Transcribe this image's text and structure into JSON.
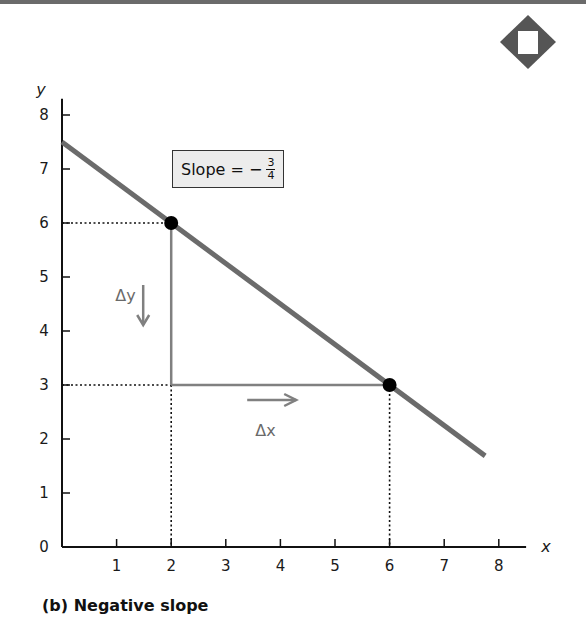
{
  "chart_data": {
    "type": "line",
    "title": "",
    "caption": "(b) Negative slope",
    "xlabel": "x",
    "ylabel": "y",
    "xlim": [
      0,
      8.5
    ],
    "ylim": [
      0,
      8.3
    ],
    "origin_label": "0",
    "x_ticks": [
      1,
      2,
      3,
      4,
      5,
      6,
      7,
      8
    ],
    "x_tick_labels": [
      "1",
      "2",
      "3",
      "4",
      "5",
      "6",
      "7",
      "8"
    ],
    "y_ticks": [
      1,
      2,
      3,
      4,
      5,
      6,
      7,
      8
    ],
    "y_tick_labels": [
      "1",
      "2",
      "3",
      "4",
      "5",
      "6",
      "7",
      "8"
    ],
    "grid": false,
    "series": [
      {
        "name": "line",
        "color": "#6b6b6b",
        "x": [
          0,
          7.75
        ],
        "y": [
          7.5,
          1.6875
        ]
      }
    ],
    "points": [
      {
        "x": 2,
        "y": 6
      },
      {
        "x": 6,
        "y": 3
      }
    ],
    "triangle": {
      "from": {
        "x": 2,
        "y": 6
      },
      "corner": {
        "x": 2,
        "y": 3
      },
      "to": {
        "x": 6,
        "y": 3
      },
      "delta_y_label": "Δy",
      "delta_x_label": "Δx",
      "delta_y_direction": "down",
      "delta_x_direction": "right"
    },
    "annotation": {
      "text": "Slope = −",
      "numerator": "3",
      "denominator": "4",
      "slope_value": -0.75
    },
    "colors": {
      "line": "#6b6b6b",
      "triangle": "#808080",
      "points": "#000000",
      "annotation_bg": "#ececec",
      "corner_badge": "#555555"
    }
  }
}
